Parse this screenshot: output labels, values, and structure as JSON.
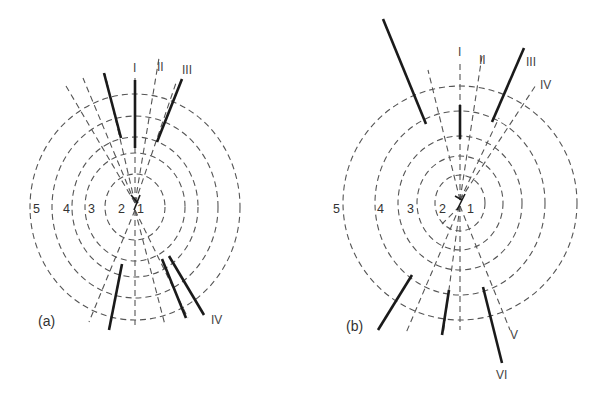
{
  "figure": {
    "panels": [
      {
        "id": "a",
        "label": "(a)",
        "ring_labels": [
          "1",
          "2",
          "3",
          "4",
          "5"
        ],
        "line_labels": [
          "I",
          "II",
          "III",
          "IV"
        ]
      },
      {
        "id": "b",
        "label": "(b)",
        "ring_labels": [
          "1",
          "2",
          "3",
          "4",
          "5"
        ],
        "line_labels": [
          "I",
          "II",
          "III",
          "IV",
          "V",
          "VI"
        ]
      }
    ]
  },
  "colors": {
    "ring": "#555555",
    "solid_line": "#1a1a1a",
    "text": "#333333",
    "background": "#ffffff"
  }
}
